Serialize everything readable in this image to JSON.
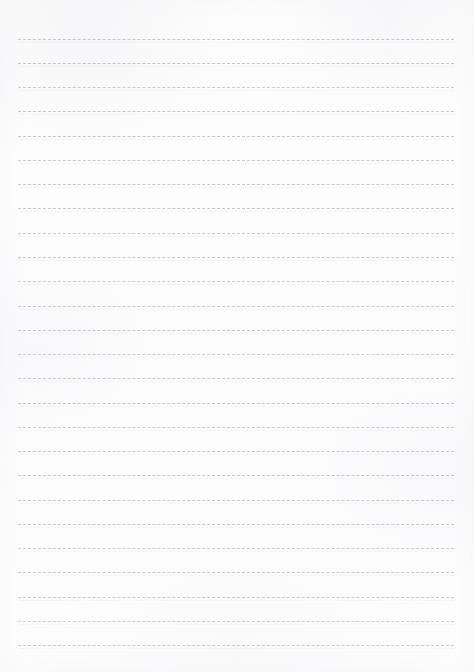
{
  "page": {
    "document_type": "blank-ruled-paper",
    "width_px": 474,
    "height_px": 672,
    "background_color": "#fdfdfd",
    "rule_color": "#b9bcc1",
    "rule_style": "dashed",
    "rule_thickness_px": 1,
    "rule_count": 26,
    "rule_left_px": 18,
    "rule_right_px": 454,
    "rule_first_y_px": 39,
    "rule_spacing_px": 24.2,
    "top_margin_px": 39,
    "bottom_margin_px": 27,
    "has_text_content": false,
    "header_text": "",
    "body_text": "",
    "footer_text": ""
  },
  "rule_lines": [
    {
      "index": 1,
      "y": 39
    },
    {
      "index": 2,
      "y": 63
    },
    {
      "index": 3,
      "y": 87
    },
    {
      "index": 4,
      "y": 111
    },
    {
      "index": 5,
      "y": 136
    },
    {
      "index": 6,
      "y": 160
    },
    {
      "index": 7,
      "y": 184
    },
    {
      "index": 8,
      "y": 208
    },
    {
      "index": 9,
      "y": 233
    },
    {
      "index": 10,
      "y": 257
    },
    {
      "index": 11,
      "y": 281
    },
    {
      "index": 12,
      "y": 306
    },
    {
      "index": 13,
      "y": 330
    },
    {
      "index": 14,
      "y": 354
    },
    {
      "index": 15,
      "y": 378
    },
    {
      "index": 16,
      "y": 403
    },
    {
      "index": 17,
      "y": 427
    },
    {
      "index": 18,
      "y": 451
    },
    {
      "index": 19,
      "y": 475
    },
    {
      "index": 20,
      "y": 500
    },
    {
      "index": 21,
      "y": 524
    },
    {
      "index": 22,
      "y": 548
    },
    {
      "index": 23,
      "y": 572
    },
    {
      "index": 24,
      "y": 597
    },
    {
      "index": 25,
      "y": 621
    },
    {
      "index": 26,
      "y": 645
    }
  ]
}
